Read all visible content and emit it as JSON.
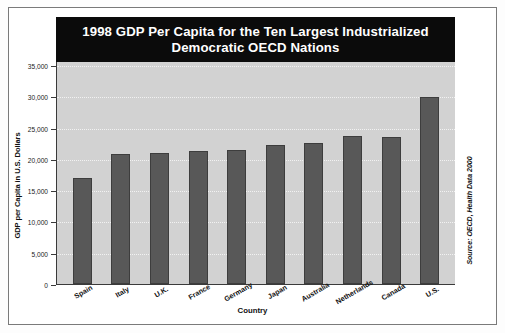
{
  "chart_data": {
    "type": "bar",
    "title": "1998 GDP Per Capita for the Ten Largest Industrialized Democratic OECD Nations",
    "title_line1": "1998 GDP Per Capita for the Ten Largest Industrialized",
    "title_line2": "Democratic OECD Nations",
    "xlabel": "Country",
    "ylabel": "GDP per Capita in U.S. Dollars",
    "ylim": [
      0,
      35000
    ],
    "ytick_labels": [
      "35,000",
      "30,000",
      "25,000",
      "20,000",
      "15,000",
      "10,000",
      "5,000",
      "0"
    ],
    "ytick_values": [
      35000,
      30000,
      25000,
      20000,
      15000,
      10000,
      5000,
      0
    ],
    "grid": true,
    "legend": "none",
    "categories": [
      "Spain",
      "Italy",
      "U.K.",
      "France",
      "Germany",
      "Japan",
      "Australia",
      "Netherlands",
      "Canada",
      "U.S."
    ],
    "values": [
      17000,
      20700,
      21000,
      21200,
      21400,
      22200,
      22500,
      23600,
      23500,
      29900
    ],
    "source": "Source: OECD, Health Data 2000",
    "colors": {
      "bar": "#585858",
      "plot_background": "#d2d2d2",
      "title_background": "#0b0b0b",
      "title_text": "#ffffff",
      "gridline": "#f2f2f2",
      "axis": "#3a3a3a"
    }
  }
}
